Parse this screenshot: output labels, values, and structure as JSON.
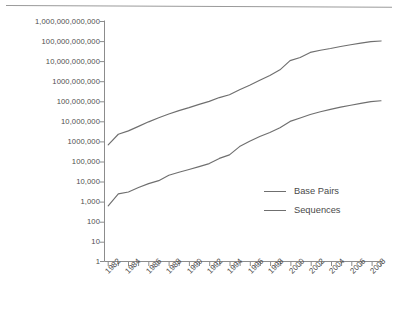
{
  "chart_data": {
    "type": "line",
    "title": "",
    "subtitle": "",
    "xlabel": "",
    "ylabel": "",
    "yscale": "log",
    "ylim": [
      1,
      1000000000000
    ],
    "xlim": [
      1982,
      2009
    ],
    "grid": false,
    "legend_position": "right-inside",
    "ytick_labels": [
      "1,000,000,000,000",
      "100,000,000,000",
      "10,000,000,000",
      "1000,000,000",
      "100,000,000",
      "10,000,000",
      "1000,000",
      "100,000",
      "10,000",
      "1,000",
      "100",
      "10",
      "1"
    ],
    "ytick_values": [
      1000000000000,
      100000000000,
      10000000000,
      1000000000,
      100000000,
      10000000,
      1000000,
      100000,
      10000,
      1000,
      100,
      10,
      1
    ],
    "xtick_labels": [
      "1982",
      "1984",
      "1986",
      "1988",
      "1990",
      "1992",
      "1994",
      "1996",
      "1998",
      "2000",
      "2002",
      "2004",
      "2006",
      "2008"
    ],
    "xtick_values": [
      1982,
      1984,
      1986,
      1988,
      1990,
      1992,
      1994,
      1996,
      1998,
      2000,
      2002,
      2004,
      2006,
      2008
    ],
    "x": [
      1982,
      1983,
      1984,
      1985,
      1986,
      1987,
      1988,
      1989,
      1990,
      1991,
      1992,
      1993,
      1994,
      1995,
      1996,
      1997,
      1998,
      1999,
      2000,
      2001,
      2002,
      2003,
      2004,
      2005,
      2006,
      2007,
      2008,
      2009
    ],
    "series": [
      {
        "name": "Base Pairs",
        "color": "#6f6f6f",
        "values": [
          680000,
          2300000,
          3400000,
          5700000,
          9600000,
          15500000,
          23800000,
          34800000,
          49200000,
          71900000,
          101000000,
          157000000,
          217000000,
          384000000,
          651000000,
          1160000000,
          2010000000,
          3840000000,
          11100000000,
          15800000000,
          28500000000,
          36600000000,
          44600000000,
          56000000000,
          69000000000,
          83000000000,
          99100000000,
          106500000000
        ]
      },
      {
        "name": "Sequences",
        "color": "#6f6f6f",
        "values": [
          610,
          2400,
          3000,
          5000,
          7800,
          11000,
          20600,
          28800,
          39500,
          55600,
          78600,
          143000,
          215000,
          555000,
          1020000,
          1760000,
          2840000,
          4860000,
          10100000,
          14900000,
          22300000,
          30900000,
          40600000,
          52000000,
          65400000,
          80400000,
          98900000,
          108400000
        ]
      }
    ],
    "legend": [
      {
        "label": "Base Pairs"
      },
      {
        "label": "Sequences"
      }
    ]
  },
  "icons": {
    "legend_line": "line-swatch-icon"
  }
}
